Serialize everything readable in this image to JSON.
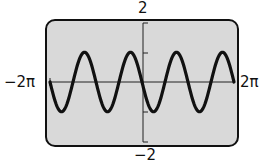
{
  "chart_data": {
    "type": "line",
    "title": "",
    "function": "y = -sin(2x)",
    "xlabel": "",
    "ylabel": "",
    "xlim": [
      -6.2832,
      6.2832
    ],
    "ylim": [
      -2,
      2
    ],
    "x_tick_labels": {
      "left": "−2π",
      "right": "2π"
    },
    "y_tick_labels": {
      "top": "2",
      "bottom": "−2"
    },
    "y_ticks": [
      -2,
      -1,
      1,
      2
    ],
    "amplitude": 1,
    "period": "π",
    "grid": false,
    "series": [
      {
        "name": "y = -sin(2x)",
        "x": [
          -6.2832,
          -5.4978,
          -4.7124,
          -3.927,
          -3.1416,
          -2.3562,
          -1.5708,
          -0.7854,
          0,
          0.7854,
          1.5708,
          2.3562,
          3.1416,
          3.927,
          4.7124,
          5.4978,
          6.2832
        ],
        "values": [
          0,
          -1,
          0,
          1,
          0,
          -1,
          0,
          1,
          0,
          -1,
          0,
          1,
          0,
          -1,
          0,
          1,
          0
        ]
      }
    ],
    "colors": {
      "screen_bg": "#d9d9d9",
      "curve": "#111111",
      "frame": "#111111"
    }
  }
}
